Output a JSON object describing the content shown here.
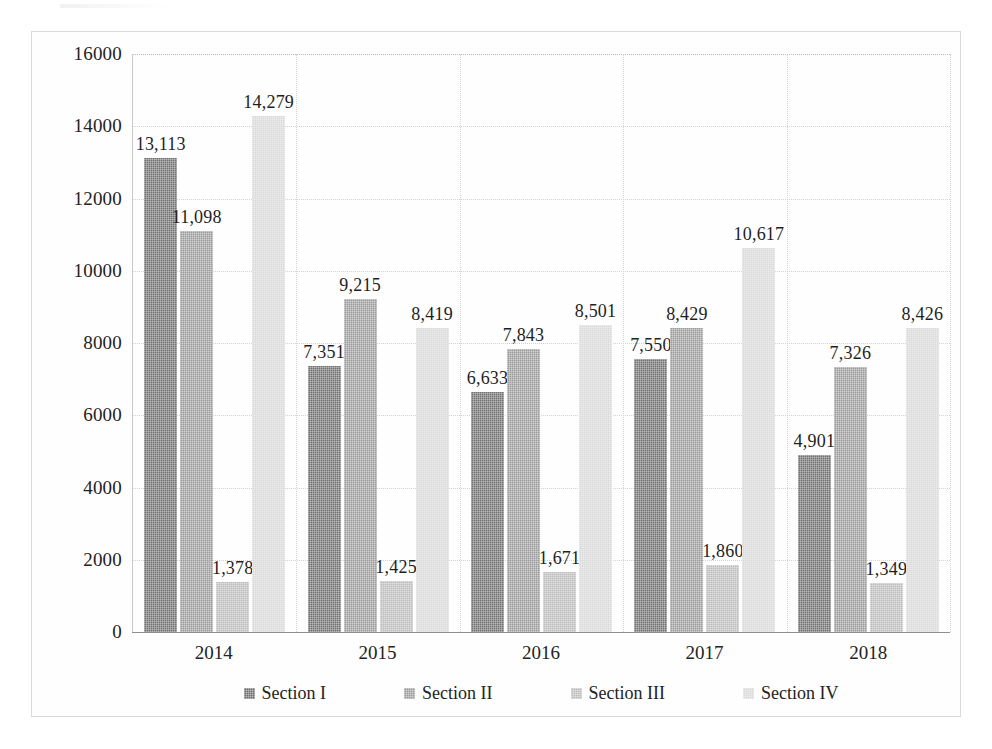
{
  "chart_data": {
    "type": "bar",
    "title": "",
    "subtitle": "",
    "xlabel": "",
    "ylabel": "",
    "categories": [
      "2014",
      "2015",
      "2016",
      "2017",
      "2018"
    ],
    "series": [
      {
        "name": "Section I",
        "color": "#6f6f6f",
        "values": [
          13113,
          7351,
          6633,
          7550,
          4901
        ],
        "labels": [
          "13,113",
          "7,351",
          "6,633",
          "7,550",
          "4,901"
        ]
      },
      {
        "name": "Section II",
        "color": "#9b9b9b",
        "values": [
          11098,
          9215,
          7843,
          8429,
          7326
        ],
        "labels": [
          "11,098",
          "9,215",
          "7,843",
          "8,429",
          "7,326"
        ]
      },
      {
        "name": "Section III",
        "color": "#bcbcbc",
        "values": [
          1378,
          1425,
          1671,
          1860,
          1349
        ],
        "labels": [
          "1,378",
          "1,425",
          "1,671",
          "1,860",
          "1,349"
        ]
      },
      {
        "name": "Section IV",
        "color": "#d9d9d9",
        "values": [
          14279,
          8419,
          8501,
          10617,
          8426
        ],
        "labels": [
          "14,279",
          "8,419",
          "8,501",
          "10,617",
          "8,426"
        ]
      }
    ],
    "ylim": [
      0,
      16000
    ],
    "ytick_step": 2000,
    "ytick_labels": [
      "16000",
      "14000",
      "12000",
      "10000",
      "8000",
      "6000",
      "4000",
      "2000",
      "0"
    ],
    "ytick_values": [
      16000,
      14000,
      12000,
      10000,
      8000,
      6000,
      4000,
      2000,
      0
    ],
    "grid": true,
    "grid_axis": "both",
    "legend_position": "bottom",
    "data_labels": true
  }
}
